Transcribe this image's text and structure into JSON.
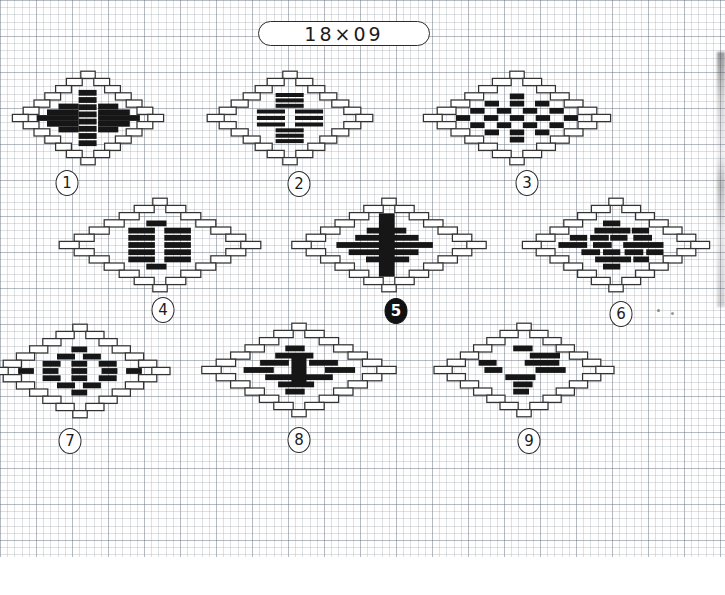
{
  "header": {
    "title": "18×09"
  },
  "grid": {
    "cell_px": 7.2,
    "area_height_px": 557,
    "page_width": 725,
    "page_height": 595
  },
  "colors": {
    "ink": "#333333",
    "stitch_fill": "#161616",
    "paper": "#ffffff",
    "grid_line": "#6e7887"
  },
  "motifs": [
    {
      "number": "1",
      "number_style": "outline",
      "cx": 88,
      "cy": 118,
      "half_width_units": 10.5,
      "badge_x": 67,
      "badge_y": 183,
      "black_bricks": [
        [
          -1.3,
          -3.5,
          2.5
        ],
        [
          -1.3,
          -2.5,
          2.5
        ],
        [
          -1.3,
          -1.5,
          2.5
        ],
        [
          -1.3,
          -0.5,
          2.5
        ],
        [
          -1.3,
          0.5,
          2.5
        ],
        [
          -1.3,
          1.5,
          2.5
        ],
        [
          -1.3,
          2.5,
          2.5
        ],
        [
          -1.3,
          3.5,
          2.5
        ],
        [
          -4.1,
          -1.6,
          2.8
        ],
        [
          -5.7,
          -0.8,
          4.4
        ],
        [
          -7.1,
          0,
          5.8
        ],
        [
          -5.7,
          0.8,
          4.4
        ],
        [
          -4.1,
          1.6,
          2.8
        ],
        [
          1.4,
          -1.6,
          2.8
        ],
        [
          1.4,
          -0.8,
          4.4
        ],
        [
          1.4,
          0,
          5.8
        ],
        [
          1.4,
          0.8,
          4.4
        ],
        [
          1.4,
          1.6,
          2.8
        ]
      ]
    },
    {
      "number": "2",
      "number_style": "outline",
      "cx": 290,
      "cy": 118,
      "half_width_units": 11.5,
      "badge_x": 299,
      "badge_y": 184,
      "black_bricks": [
        [
          -2,
          -3.2,
          3.9,
          0.55
        ],
        [
          -2,
          -2.45,
          3.9,
          0.55
        ],
        [
          -2,
          -1.7,
          3.9,
          0.55
        ],
        [
          -2,
          1.7,
          3.9,
          0.55
        ],
        [
          -2,
          2.45,
          3.9,
          0.55
        ],
        [
          -2,
          3.2,
          3.9,
          0.55
        ],
        [
          -4.6,
          -0.9,
          3.9,
          0.55
        ],
        [
          -4.6,
          0,
          3.9,
          0.55
        ],
        [
          -4.6,
          0.9,
          3.9,
          0.55
        ],
        [
          0.7,
          -0.9,
          3.9,
          0.55
        ],
        [
          0.7,
          0,
          3.9,
          0.55
        ],
        [
          0.7,
          0.9,
          3.9,
          0.55
        ]
      ]
    },
    {
      "number": "3",
      "number_style": "outline",
      "cx": 517,
      "cy": 118,
      "half_width_units": 13,
      "badge_x": 527,
      "badge_y": 183,
      "black_bricks": [
        [
          -1,
          -3,
          2
        ],
        [
          -4.5,
          -2,
          2
        ],
        [
          -1,
          -2,
          2
        ],
        [
          2.5,
          -2,
          2
        ],
        [
          -6.5,
          -1,
          2
        ],
        [
          -2.8,
          -1,
          2
        ],
        [
          0.8,
          -1,
          2
        ],
        [
          4.5,
          -1,
          2
        ],
        [
          -8.5,
          0,
          2
        ],
        [
          -4.6,
          0,
          2
        ],
        [
          -1,
          0,
          2
        ],
        [
          2.6,
          0,
          2
        ],
        [
          6.5,
          0,
          2
        ],
        [
          -6.5,
          1,
          2
        ],
        [
          -2.8,
          1,
          2
        ],
        [
          0.8,
          1,
          2
        ],
        [
          4.5,
          1,
          2
        ],
        [
          -4.5,
          2,
          2
        ],
        [
          -1,
          2,
          2
        ],
        [
          2.5,
          2,
          2
        ],
        [
          -1,
          3,
          2
        ]
      ]
    },
    {
      "number": "4",
      "number_style": "outline",
      "cx": 160,
      "cy": 245,
      "half_width_units": 14,
      "badge_x": 163,
      "badge_y": 310,
      "black_bricks": [
        [
          -1.9,
          -3,
          2.8
        ],
        [
          -4.4,
          -2,
          3.7
        ],
        [
          0.6,
          -2,
          3.7
        ],
        [
          -4.4,
          -1,
          3.7
        ],
        [
          0.6,
          -1,
          3.7
        ],
        [
          -4.4,
          0,
          3.7
        ],
        [
          0.6,
          0,
          3.7
        ],
        [
          -4.4,
          1,
          3.7
        ],
        [
          0.6,
          1,
          3.7
        ],
        [
          -4.4,
          2,
          3.7
        ],
        [
          0.6,
          2,
          3.7
        ],
        [
          -1.9,
          3,
          2.8
        ]
      ]
    },
    {
      "number": "5",
      "number_style": "filled",
      "cx": 389,
      "cy": 245,
      "half_width_units": 13.5,
      "badge_x": 396,
      "badge_y": 311,
      "black_bricks": [
        [
          -3.1,
          -2,
          5.5
        ],
        [
          -4.7,
          -1,
          8.8
        ],
        [
          -7.3,
          0,
          13.4
        ],
        [
          -5.6,
          1,
          9.7
        ],
        [
          -3.2,
          2,
          6
        ],
        [
          -1.4,
          0,
          2.2,
          8.8
        ]
      ]
    },
    {
      "number": "6",
      "number_style": "outline",
      "cx": 616,
      "cy": 245,
      "half_width_units": 13,
      "badge_x": 621,
      "badge_y": 314,
      "black_bricks": [
        [
          -1.8,
          -3,
          2.4
        ],
        [
          -3,
          -2,
          5
        ],
        [
          2.2,
          -2,
          2.4
        ],
        [
          -6.4,
          -1,
          2.4
        ],
        [
          -3.6,
          -1,
          2.6
        ],
        [
          -0.8,
          -1,
          2.4
        ],
        [
          2.4,
          -1,
          2.6
        ],
        [
          -8,
          0,
          4
        ],
        [
          -3.2,
          0,
          2.6
        ],
        [
          1,
          0,
          5.6
        ],
        [
          -4.8,
          1,
          2.6
        ],
        [
          -1.8,
          1,
          2.4
        ],
        [
          1.2,
          1,
          2.6
        ],
        [
          4.2,
          1,
          2.4
        ],
        [
          -2.9,
          2,
          5
        ],
        [
          2.4,
          2,
          2.2
        ],
        [
          -1.8,
          3,
          2.4
        ]
      ]
    },
    {
      "number": "7",
      "number_style": "outline",
      "cx": 80,
      "cy": 371,
      "half_width_units": 12.5,
      "badge_x": 70,
      "badge_y": 441,
      "black_bricks": [
        [
          -1.2,
          -3,
          2.2
        ],
        [
          -3.2,
          -2,
          2.5
        ],
        [
          0.4,
          -2,
          2.5
        ],
        [
          -5.2,
          -1,
          2.5
        ],
        [
          -1.2,
          -1,
          2.2
        ],
        [
          2.6,
          -1,
          2.5
        ],
        [
          -8.6,
          0,
          2.2
        ],
        [
          -5.2,
          0,
          2.2
        ],
        [
          -1.2,
          0,
          2.2
        ],
        [
          3,
          0,
          2.2
        ],
        [
          6.4,
          0,
          2.2
        ],
        [
          -5.2,
          1,
          2.5
        ],
        [
          -1.2,
          1,
          2.2
        ],
        [
          2.6,
          1,
          2.5
        ],
        [
          -3.2,
          2,
          2.5
        ],
        [
          0.4,
          2,
          2.5
        ],
        [
          -1.2,
          3,
          2.2
        ]
      ]
    },
    {
      "number": "8",
      "number_style": "outline",
      "cx": 299,
      "cy": 370,
      "half_width_units": 13.5,
      "badge_x": 299,
      "badge_y": 440,
      "black_bricks": [
        [
          -1.9,
          -3,
          2.7
        ],
        [
          -3.3,
          -2,
          5.3
        ],
        [
          -5.4,
          -1,
          4
        ],
        [
          1.4,
          -1,
          4
        ],
        [
          -7.7,
          0,
          4.2
        ],
        [
          3.6,
          0,
          4.2
        ],
        [
          -4.7,
          1,
          4
        ],
        [
          0.7,
          1,
          4
        ],
        [
          -2.9,
          2,
          5
        ],
        [
          -1.9,
          3,
          2.7
        ],
        [
          -1.05,
          0,
          2.1,
          4.3
        ]
      ]
    },
    {
      "number": "9",
      "number_style": "outline",
      "cx": 524,
      "cy": 370,
      "half_width_units": 12.5,
      "badge_x": 529,
      "badge_y": 441,
      "black_bricks": [
        [
          -1.5,
          -3,
          2.7
        ],
        [
          0.8,
          -2,
          4.2
        ],
        [
          -6.3,
          -1,
          2.5
        ],
        [
          0.1,
          -1,
          4.8
        ],
        [
          -5.5,
          0,
          2.5
        ],
        [
          1.6,
          0,
          4.2
        ],
        [
          -2.6,
          1,
          4.2
        ],
        [
          -1.5,
          2,
          2.7
        ],
        [
          -1.5,
          3,
          2.2
        ]
      ]
    }
  ]
}
